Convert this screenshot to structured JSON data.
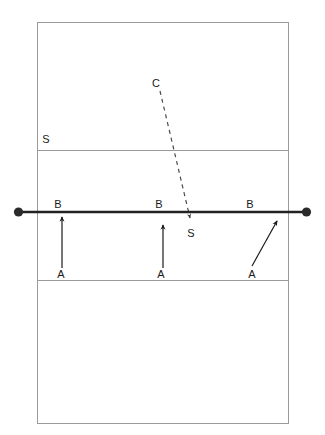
{
  "diagram": {
    "kind": "volleyball-court-formation-diagram",
    "colors": {
      "background": "#ffffff",
      "court_line": "#9a9a9a",
      "net_line": "#222222",
      "net_post_dot": "#2b2b2b",
      "movement_arrow": "#1a1a1a",
      "serve_path_dashed": "#4a4a4a",
      "label_text": "#1a1a1a"
    },
    "court": {
      "left": 37,
      "top": 22,
      "right": 289,
      "bottom": 424,
      "line_width": 1,
      "attack_line_upper_y": 150,
      "attack_line_lower_y": 280
    },
    "net": {
      "y": 212,
      "x_start": 18,
      "x_end": 307,
      "line_width": 2.6,
      "post_dot_radius": 4.6
    },
    "serve_path": {
      "style": "dashed",
      "dash_pattern": "4 4",
      "line_width": 1.2,
      "from_x": 160,
      "from_y": 91,
      "to_x": 190,
      "to_y": 218,
      "arrowhead": "down"
    },
    "movement_arrows": [
      {
        "name": "left-blocker-advance",
        "x1": 62,
        "y1": 268,
        "x2": 62,
        "y2": 217,
        "shape": "vertical"
      },
      {
        "name": "middle-blocker-advance",
        "x1": 163,
        "y1": 268,
        "x2": 163,
        "y2": 225,
        "shape": "vertical"
      },
      {
        "name": "right-blocker-advance",
        "x1": 252,
        "y1": 266,
        "x2": 277,
        "y2": 221,
        "shape": "diagonal"
      }
    ],
    "labels": [
      {
        "name": "label-setter-backcourt",
        "text": "S",
        "x": 46,
        "y": 139
      },
      {
        "name": "label-coach-serve-origin",
        "text": "C",
        "x": 156,
        "y": 83
      },
      {
        "name": "label-block-position-left",
        "text": "B",
        "x": 58,
        "y": 204
      },
      {
        "name": "label-block-position-middle",
        "text": "B",
        "x": 159,
        "y": 204
      },
      {
        "name": "label-block-position-right",
        "text": "B",
        "x": 250,
        "y": 204
      },
      {
        "name": "label-serve-target",
        "text": "S",
        "x": 191,
        "y": 233
      },
      {
        "name": "label-approach-start-left",
        "text": "A",
        "x": 61,
        "y": 274
      },
      {
        "name": "label-approach-start-middle",
        "text": "A",
        "x": 161,
        "y": 274
      },
      {
        "name": "label-approach-start-right",
        "text": "A",
        "x": 252,
        "y": 274
      }
    ]
  }
}
